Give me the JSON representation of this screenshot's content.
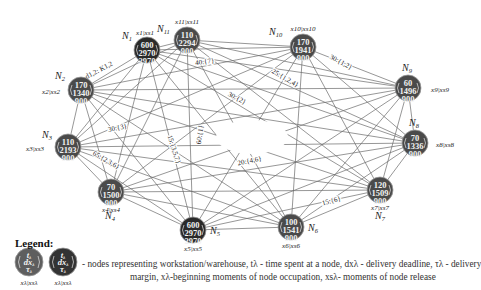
{
  "diagram": {
    "colors": {
      "node_regular": "#4a4a4a",
      "node_highlight": "#2a2a2a",
      "edge": "#6a6a6a",
      "background": "#ffffff"
    },
    "nodes": [
      {
        "id": "N1",
        "label": "N",
        "sub": "1",
        "cx": 147,
        "cy": 50,
        "t": "600",
        "dx": "2970",
        "tau": "2970",
        "xs": "x1|xs1",
        "highlight": true
      },
      {
        "id": "N2",
        "label": "N",
        "sub": "2",
        "cx": 81,
        "cy": 90,
        "t": "170",
        "dx": "1340",
        "tau": "900",
        "xs": "x2|xs2",
        "highlight": false
      },
      {
        "id": "N3",
        "label": "N",
        "sub": "3",
        "cx": 68,
        "cy": 147,
        "t": "110",
        "dx": "2193",
        "tau": "900",
        "xs": "x3|xs3",
        "highlight": false
      },
      {
        "id": "N4",
        "label": "N",
        "sub": "4",
        "cx": 111,
        "cy": 192,
        "t": "70",
        "dx": "1500",
        "tau": "900",
        "xs": "x4|xs4",
        "highlight": false
      },
      {
        "id": "N5",
        "label": "N",
        "sub": "5",
        "cx": 193,
        "cy": 230,
        "t": "600",
        "dx": "2970",
        "tau": "2970",
        "xs": "x5|xs5",
        "highlight": true
      },
      {
        "id": "N6",
        "label": "N",
        "sub": "6",
        "cx": 291,
        "cy": 227,
        "t": "100",
        "dx": "1541",
        "tau": "900",
        "xs": "x6|xs6",
        "highlight": false
      },
      {
        "id": "N7",
        "label": "N",
        "sub": "7",
        "cx": 380,
        "cy": 190,
        "t": "120",
        "dx": "1509",
        "tau": "900",
        "xs": "x7|xs7",
        "highlight": false
      },
      {
        "id": "N8",
        "label": "N",
        "sub": "8",
        "cx": 415,
        "cy": 143,
        "t": "70",
        "dx": "1336",
        "tau": "900",
        "xs": "x8|xs8",
        "highlight": false
      },
      {
        "id": "N9",
        "label": "N",
        "sub": "9",
        "cx": 408,
        "cy": 88,
        "t": "60",
        "dx": "1496",
        "tau": "900",
        "xs": "x9|xs9",
        "highlight": false
      },
      {
        "id": "N10",
        "label": "N",
        "sub": "10",
        "cx": 303,
        "cy": 47,
        "t": "170",
        "dx": "1941",
        "tau": "900",
        "xs": "x10|xs10",
        "highlight": false
      },
      {
        "id": "N11",
        "label": "N",
        "sub": "11",
        "cx": 187,
        "cy": 40,
        "t": "110",
        "dx": "2294",
        "tau": "900",
        "xs": "x11|xs11",
        "highlight": false
      }
    ],
    "edge_labels": [
      {
        "text": "d1,2: K1,2",
        "x": 100,
        "y": 72,
        "rotate": -28
      },
      {
        "text": "40:{7}",
        "x": 205,
        "y": 64,
        "rotate": -8
      },
      {
        "text": "30:{1,2}",
        "x": 340,
        "y": 64,
        "rotate": 28
      },
      {
        "text": "25:{1,2,4}",
        "x": 284,
        "y": 80,
        "rotate": 30
      },
      {
        "text": "30:{2}",
        "x": 236,
        "y": 100,
        "rotate": 28
      },
      {
        "text": "30:{3}",
        "x": 118,
        "y": 130,
        "rotate": -12
      },
      {
        "text": "60:{1}",
        "x": 202,
        "y": 135,
        "rotate": -82
      },
      {
        "text": "15:{3,5,7}",
        "x": 172,
        "y": 150,
        "rotate": 72
      },
      {
        "text": "20:{4,6}",
        "x": 250,
        "y": 163,
        "rotate": -12
      },
      {
        "text": "65:{2,3,6}",
        "x": 105,
        "y": 162,
        "rotate": 30
      },
      {
        "text": "15:{6}",
        "x": 332,
        "y": 203,
        "rotate": -15
      }
    ]
  },
  "legend": {
    "title": "Legend:",
    "symbol_top": "t",
    "symbol_mid": "dx",
    "symbol_bot": "τ",
    "symbol_sub": "λ",
    "symbol_caption": "xλ|xsλ",
    "line1": "- nodes representing workstation/warehouse, tλ - time spent at a node, dxλ - delivery deadline, τλ - delivery",
    "line2": "margin,  xλ-beginning moments of node occupation, xsλ- moments of node release"
  }
}
